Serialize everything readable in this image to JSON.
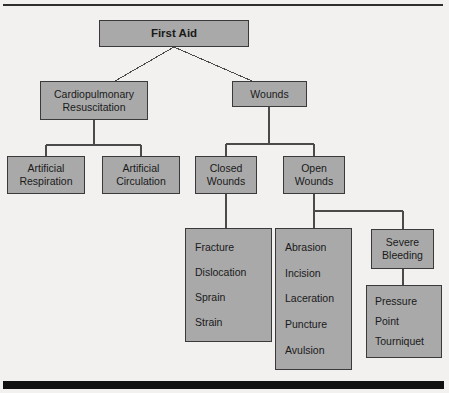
{
  "diagram": {
    "type": "hierarchy-tree",
    "colors": {
      "node_fill": "#a9a9a9",
      "node_border": "#3a3a3a",
      "text": "#1a1a1a",
      "edge": "#4a4a4a",
      "rule": "#2e2e2e",
      "footer_bar": "#111111",
      "background": "#f2f1ef"
    },
    "nodes": {
      "root": {
        "lines": [
          "First Aid"
        ]
      },
      "cpr": {
        "lines": [
          "Cardiopulmonary",
          "Resuscitation"
        ]
      },
      "wounds": {
        "lines": [
          "Wounds"
        ]
      },
      "artificial_respiration": {
        "lines": [
          "Artificial",
          "Respiration"
        ]
      },
      "artificial_circulation": {
        "lines": [
          "Artificial",
          "Circulation"
        ]
      },
      "closed_wounds": {
        "lines": [
          "Closed",
          "Wounds"
        ]
      },
      "open_wounds": {
        "lines": [
          "Open",
          "Wounds"
        ]
      },
      "closed_wound_types": {
        "lines": [
          "Fracture",
          "Dislocation",
          "Sprain",
          "Strain"
        ]
      },
      "open_wound_types": {
        "lines": [
          "Abrasion",
          "Incision",
          "Laceration",
          "Puncture",
          "Avulsion"
        ]
      },
      "severe_bleeding": {
        "lines": [
          "Severe",
          "Bleeding"
        ]
      },
      "bleeding_control": {
        "lines": [
          "Pressure",
          "Point",
          "Tourniquet"
        ]
      }
    }
  }
}
